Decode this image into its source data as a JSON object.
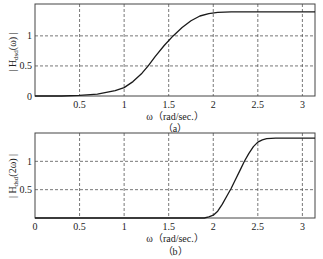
{
  "chart_data": [
    {
      "type": "line",
      "panel": "a",
      "caption": "(a)",
      "title": "",
      "xlabel": "ω (rad/sec.)",
      "ylabel": "| H_dsd(ω) |",
      "xlim": [
        0,
        3.1416
      ],
      "ylim": [
        0,
        1.53
      ],
      "xticks": [
        0.5,
        1,
        1.5,
        2,
        2.5,
        3
      ],
      "xtick_labels": [
        "0.5",
        "1",
        "1.5",
        "2",
        "2.5",
        "3"
      ],
      "yticks": [
        0,
        0.5,
        1
      ],
      "ytick_labels": [
        "0",
        "0.5",
        "1"
      ],
      "grid": true,
      "grid_style": "dashed",
      "series": [
        {
          "name": "|H_dsd(ω)|",
          "x": [
            0,
            0.3,
            0.5,
            0.7,
            0.8,
            0.9,
            1.0,
            1.1,
            1.2,
            1.27,
            1.35,
            1.45,
            1.55,
            1.65,
            1.75,
            1.85,
            1.95,
            2.05,
            2.2,
            2.5,
            3.0,
            3.1416
          ],
          "y": [
            0,
            0.0,
            0.01,
            0.03,
            0.06,
            0.09,
            0.14,
            0.24,
            0.38,
            0.5,
            0.66,
            0.84,
            1.0,
            1.14,
            1.25,
            1.33,
            1.37,
            1.39,
            1.4,
            1.4,
            1.4,
            1.4
          ]
        }
      ]
    },
    {
      "type": "line",
      "panel": "b",
      "caption": "(b)",
      "title": "",
      "xlabel": "ω (rad/sec.)",
      "ylabel": "| H_dsd(2ω) |",
      "xlim": [
        0,
        3.1416
      ],
      "ylim": [
        0,
        1.5
      ],
      "xticks": [
        0,
        0.5,
        1,
        1.5,
        2,
        2.5,
        3
      ],
      "xtick_labels": [
        "0",
        "0.5",
        "1",
        "1.5",
        "2",
        "2.5",
        "3"
      ],
      "yticks": [
        0.5,
        1
      ],
      "ytick_labels": [
        "0.5",
        "1"
      ],
      "grid": true,
      "grid_style": "dashed",
      "series": [
        {
          "name": "|H_dsd(2ω)|",
          "x": [
            0,
            1.0,
            1.9,
            1.95,
            2.0,
            2.05,
            2.1,
            2.15,
            2.2,
            2.25,
            2.3,
            2.35,
            2.4,
            2.45,
            2.5,
            2.55,
            2.6,
            2.7,
            3.0,
            3.1416
          ],
          "y": [
            0,
            0,
            0.0,
            0.02,
            0.05,
            0.12,
            0.24,
            0.38,
            0.52,
            0.68,
            0.84,
            1.0,
            1.14,
            1.26,
            1.34,
            1.38,
            1.4,
            1.41,
            1.41,
            1.41
          ]
        }
      ]
    }
  ],
  "panels": {
    "a": {
      "ylabel_main": "| H",
      "ylabel_sub": "dsd",
      "ylabel_arg": "(ω) |",
      "xlabel": "ω（rad/sec.）",
      "caption": "（a）"
    },
    "b": {
      "ylabel_main": "| H",
      "ylabel_sub": "dsd",
      "ylabel_arg": "(2ω) |",
      "xlabel": "ω（rad/sec.）",
      "caption": "（b）"
    }
  },
  "colors": {
    "line": "#1a1a1a",
    "grid": "#555555",
    "frame": "#444444",
    "background": "#ffffff"
  }
}
